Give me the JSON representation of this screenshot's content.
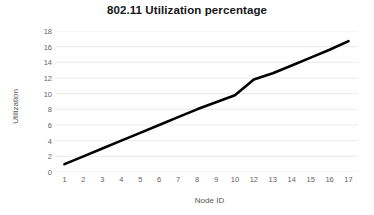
{
  "chart_data": {
    "type": "line",
    "title": "802.11 Utilization percentage",
    "xlabel": "Node ID",
    "ylabel": "Utilization",
    "categories": [
      "1",
      "2",
      "3",
      "4",
      "5",
      "6",
      "7",
      "8",
      "9",
      "10",
      "12",
      "13",
      "14",
      "15",
      "16",
      "17"
    ],
    "values": [
      1.0,
      2.0,
      3.0,
      4.0,
      5.0,
      6.0,
      7.0,
      8.0,
      8.9,
      9.8,
      11.8,
      12.6,
      13.6,
      14.6,
      15.6,
      16.7
    ],
    "series": [
      {
        "name": "Utilization",
        "values": [
          1.0,
          2.0,
          3.0,
          4.0,
          5.0,
          6.0,
          7.0,
          8.0,
          8.9,
          9.8,
          11.8,
          12.6,
          13.6,
          14.6,
          15.6,
          16.7
        ]
      }
    ],
    "ylim": [
      0,
      18
    ],
    "y_ticks": [
      0,
      2,
      4,
      6,
      8,
      10,
      12,
      14,
      16,
      18
    ],
    "grid": "horizontal",
    "legend": "none",
    "markers": "none",
    "line_color": "#000000",
    "line_width": 2.6,
    "grid_color": "#e9e9e9",
    "background_color": "#ffffff",
    "title_color": "#161616",
    "tick_label_color": "#636363"
  }
}
